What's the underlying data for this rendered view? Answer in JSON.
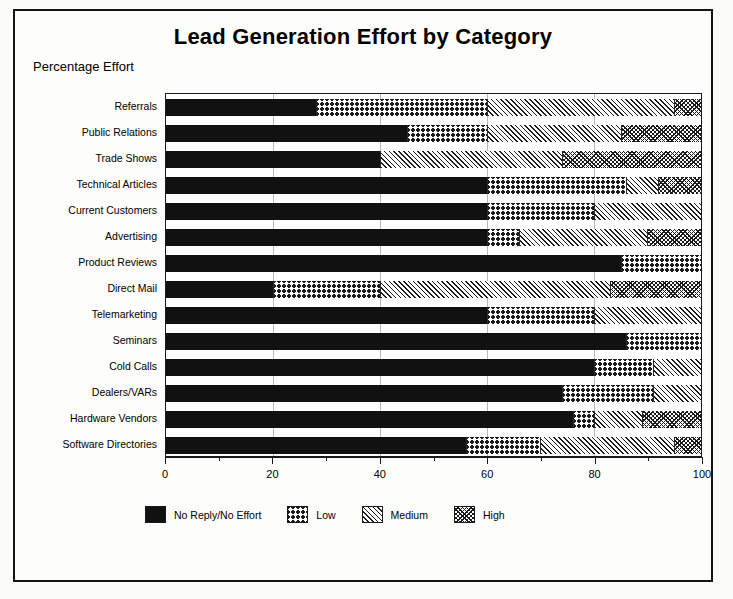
{
  "chart_title": "Lead Generation Effort by Category",
  "subtitle": "Percentage Effort",
  "legend": {
    "items": [
      {
        "label": "No Reply/No Effort",
        "key": "none",
        "swatch": "solid-black-swatch"
      },
      {
        "label": "Low",
        "key": "low",
        "swatch": "crosshatch-swatch"
      },
      {
        "label": "Medium",
        "key": "medium",
        "swatch": "diagonal-hatch-swatch"
      },
      {
        "label": "High",
        "key": "high",
        "swatch": "dense-hatch-swatch"
      }
    ]
  },
  "chart_data": {
    "type": "bar",
    "orientation": "horizontal",
    "stacked": true,
    "stack_mode": "percent",
    "title": "Lead Generation Effort by Category",
    "subtitle": "Percentage Effort",
    "xlabel": "",
    "ylabel": "",
    "xlim": [
      0,
      100
    ],
    "xticks": [
      0,
      20,
      40,
      60,
      80,
      100
    ],
    "xtick_labels": [
      "0",
      "20",
      "40",
      "60",
      "80",
      "100"
    ],
    "minor_xticks": [
      10,
      30,
      50,
      70,
      90
    ],
    "grid": true,
    "legend_position": "bottom",
    "categories": [
      "Referrals",
      "Public Relations",
      "Trade Shows",
      "Technical Articles",
      "Current Customers",
      "Advertising",
      "Product Reviews",
      "Direct Mail",
      "Telemarketing",
      "Seminars",
      "Cold Calls",
      "Dealers/VARs",
      "Hardware Vendors",
      "Software Directories"
    ],
    "series": [
      {
        "name": "No Reply/No Effort",
        "values": [
          28,
          45,
          40,
          60,
          60,
          60,
          85,
          20,
          60,
          86,
          80,
          74,
          76,
          56
        ]
      },
      {
        "name": "Low",
        "values": [
          32,
          15,
          0,
          26,
          20,
          6,
          15,
          20,
          20,
          14,
          11,
          17,
          4,
          14
        ]
      },
      {
        "name": "Medium",
        "values": [
          35,
          25,
          34,
          6,
          20,
          24,
          0,
          43,
          20,
          0,
          9,
          9,
          9,
          25
        ]
      },
      {
        "name": "High",
        "values": [
          5,
          15,
          26,
          8,
          0,
          10,
          0,
          17,
          0,
          0,
          0,
          0,
          11,
          5
        ]
      }
    ]
  }
}
